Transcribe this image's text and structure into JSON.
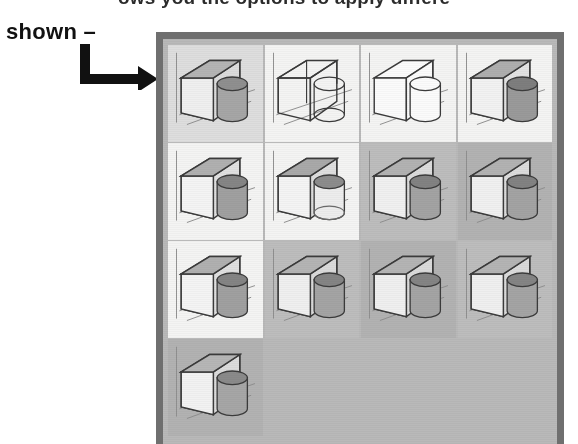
{
  "caption": {
    "clipped_top_text": "ows you the options to apply differe",
    "shown_label": "shown –"
  },
  "arrow": {
    "icon": "elbow-arrow-right-icon"
  },
  "gallery": {
    "columns": 4,
    "rows": 4,
    "thumbnail_count": 13,
    "border_color": "#6f6f6f",
    "panel_color": "#b9b9b9",
    "thumbnails": [
      {
        "index": 1,
        "style": "shaded-with-edges",
        "cell_bg": "bg-light",
        "box_fill": "#efefef",
        "box_top_fill": "#b4b4b4",
        "box_side_fill": "#dcdcdc",
        "cyl_fill": "#a6a6a6",
        "cyl_top_fill": "#8f8f8f",
        "wireframe": false,
        "hidden_lines": false
      },
      {
        "index": 2,
        "style": "wireframe-hidden-visible",
        "cell_bg": "bg-white",
        "box_fill": "none",
        "box_top_fill": "none",
        "box_side_fill": "none",
        "cyl_fill": "none",
        "cyl_top_fill": "none",
        "wireframe": true,
        "hidden_lines": true
      },
      {
        "index": 3,
        "style": "wireframe-hidden-removed",
        "cell_bg": "bg-white",
        "box_fill": "#fbfbfb",
        "box_top_fill": "#fbfbfb",
        "box_side_fill": "#fbfbfb",
        "cyl_fill": "#fbfbfb",
        "cyl_top_fill": "#fbfbfb",
        "wireframe": true,
        "hidden_lines": false
      },
      {
        "index": 4,
        "style": "shaded-dark-cylinder",
        "cell_bg": "bg-white",
        "box_fill": "#f2f2f2",
        "box_top_fill": "#aeaeae",
        "box_side_fill": "#e2e2e2",
        "cyl_fill": "#9a9a9a",
        "cyl_top_fill": "#7e7e7e",
        "wireframe": false,
        "hidden_lines": false
      },
      {
        "index": 5,
        "style": "shaded-with-edges",
        "cell_bg": "bg-white",
        "box_fill": "#f4f4f4",
        "box_top_fill": "#b0b0b0",
        "box_side_fill": "#e0e0e0",
        "cyl_fill": "#a0a0a0",
        "cyl_top_fill": "#858585",
        "wireframe": false,
        "hidden_lines": false
      },
      {
        "index": 6,
        "style": "shaded-transparent-cyl",
        "cell_bg": "bg-white",
        "box_fill": "#f4f4f4",
        "box_top_fill": "#a9a9a9",
        "box_side_fill": "#dedede",
        "cyl_fill": "#ededed",
        "cyl_top_fill": "#8c8c8c",
        "wireframe": false,
        "hidden_lines": true
      },
      {
        "index": 7,
        "style": "shaded-realistic",
        "cell_bg": "bg-gray",
        "box_fill": "#f0f0f0",
        "box_top_fill": "#b2b2b2",
        "box_side_fill": "#dcdcdc",
        "cyl_fill": "#a3a3a3",
        "cyl_top_fill": "#828282",
        "wireframe": false,
        "hidden_lines": false
      },
      {
        "index": 8,
        "style": "shaded-realistic",
        "cell_bg": "bg-dark",
        "box_fill": "#f0f0f0",
        "box_top_fill": "#b2b2b2",
        "box_side_fill": "#dcdcdc",
        "cyl_fill": "#a3a3a3",
        "cyl_top_fill": "#828282",
        "wireframe": false,
        "hidden_lines": false
      },
      {
        "index": 9,
        "style": "shaded-with-edges",
        "cell_bg": "bg-white",
        "box_fill": "#f4f4f4",
        "box_top_fill": "#b0b0b0",
        "box_side_fill": "#e0e0e0",
        "cyl_fill": "#a0a0a0",
        "cyl_top_fill": "#848484",
        "wireframe": false,
        "hidden_lines": false
      },
      {
        "index": 10,
        "style": "shaded-realistic",
        "cell_bg": "bg-gray",
        "box_fill": "#efefef",
        "box_top_fill": "#b4b4b4",
        "box_side_fill": "#dadada",
        "cyl_fill": "#a4a4a4",
        "cyl_top_fill": "#848484",
        "wireframe": false,
        "hidden_lines": false
      },
      {
        "index": 11,
        "style": "shaded-realistic",
        "cell_bg": "bg-dark",
        "box_fill": "#efefef",
        "box_top_fill": "#b4b4b4",
        "box_side_fill": "#dadada",
        "cyl_fill": "#a4a4a4",
        "cyl_top_fill": "#848484",
        "wireframe": false,
        "hidden_lines": false
      },
      {
        "index": 12,
        "style": "shaded-realistic",
        "cell_bg": "bg-gray",
        "box_fill": "#efefef",
        "box_top_fill": "#b4b4b4",
        "box_side_fill": "#dadada",
        "cyl_fill": "#a4a4a4",
        "cyl_top_fill": "#848484",
        "wireframe": false,
        "hidden_lines": false
      },
      {
        "index": 13,
        "style": "shaded-with-edges",
        "cell_bg": "bg-dark",
        "box_fill": "#f2f2f2",
        "box_top_fill": "#b6b6b6",
        "box_side_fill": "#dcdcdc",
        "cyl_fill": "#a6a6a6",
        "cyl_top_fill": "#8a8a8a",
        "wireframe": false,
        "hidden_lines": false
      }
    ]
  }
}
